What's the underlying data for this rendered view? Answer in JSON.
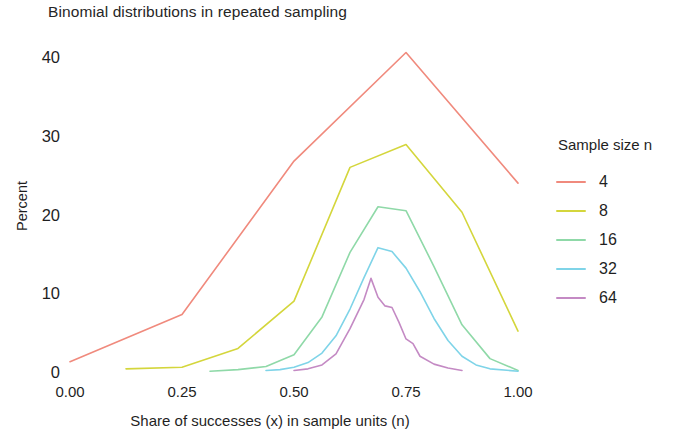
{
  "chart_data": {
    "type": "line",
    "title": "Binomial distributions in repeated sampling",
    "xlabel": "Share of successes (x) in sample units (n)",
    "ylabel": "Percent",
    "xlim": [
      0,
      1
    ],
    "ylim": [
      0,
      42
    ],
    "xticks": [
      "0.00",
      "0.25",
      "0.50",
      "0.75",
      "1.00"
    ],
    "xtick_values": [
      0.0,
      0.25,
      0.5,
      0.75,
      1.0
    ],
    "yticks": [
      "0",
      "10",
      "20",
      "30",
      "40"
    ],
    "ytick_values": [
      0,
      10,
      20,
      30,
      40
    ],
    "grid": false,
    "legend_position": "right",
    "legend_title": "Sample size n",
    "series": [
      {
        "name": "4",
        "color": "#f08a7d",
        "x": [
          0.0,
          0.25,
          0.5,
          0.75,
          1.0
        ],
        "values": [
          1.3,
          7.3,
          26.8,
          40.6,
          24.0
        ]
      },
      {
        "name": "8",
        "color": "#d4d63c",
        "x": [
          0.125,
          0.25,
          0.375,
          0.5,
          0.625,
          0.75,
          0.875,
          1.0
        ],
        "values": [
          0.4,
          0.6,
          3.0,
          9.0,
          26.0,
          28.9,
          20.3,
          5.2
        ]
      },
      {
        "name": "16",
        "color": "#8fd9a8",
        "x": [
          0.3125,
          0.375,
          0.4375,
          0.5,
          0.5625,
          0.625,
          0.6875,
          0.75,
          0.8125,
          0.875,
          0.9375,
          1.0
        ],
        "values": [
          0.1,
          0.3,
          0.7,
          2.2,
          7.0,
          15.2,
          21.0,
          20.5,
          13.4,
          6.0,
          1.7,
          0.2
        ]
      },
      {
        "name": "32",
        "color": "#7fd4e8",
        "x": [
          0.4375,
          0.46875,
          0.5,
          0.53125,
          0.5625,
          0.59375,
          0.625,
          0.65625,
          0.6875,
          0.71875,
          0.75,
          0.78125,
          0.8125,
          0.84375,
          0.875,
          0.90625,
          0.9375,
          1.0
        ],
        "values": [
          0.2,
          0.3,
          0.6,
          1.2,
          2.4,
          4.6,
          8.0,
          12.0,
          15.8,
          15.3,
          13.2,
          10.2,
          6.8,
          4.0,
          2.0,
          0.9,
          0.4,
          0.1
        ]
      },
      {
        "name": "64",
        "color": "#c48ac4",
        "x": [
          0.5,
          0.53125,
          0.5625,
          0.59375,
          0.625,
          0.65625,
          0.671875,
          0.6875,
          0.703125,
          0.71875,
          0.734375,
          0.75,
          0.765625,
          0.78125,
          0.8125,
          0.84375,
          0.875
        ],
        "values": [
          0.2,
          0.4,
          0.9,
          2.3,
          5.5,
          9.2,
          11.9,
          9.5,
          8.4,
          8.2,
          6.3,
          4.2,
          3.6,
          2.0,
          1.0,
          0.5,
          0.2
        ]
      }
    ]
  }
}
